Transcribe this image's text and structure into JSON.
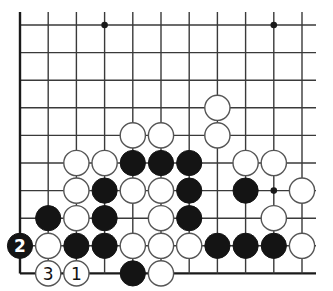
{
  "diagram": {
    "type": "go-board-fragment",
    "columns": 11,
    "rows": 10,
    "edges": {
      "left": true,
      "bottom": true,
      "top": false,
      "right": false
    },
    "origin_x": 20,
    "origin_y": 25,
    "spacing_x": 28.2,
    "spacing_y": 27.6,
    "colors": {
      "black": "#141414",
      "white": "#ffffff",
      "line": "#3a3a3a"
    },
    "star_points": [
      {
        "col": 3,
        "row": 0
      },
      {
        "col": 9,
        "row": 0
      },
      {
        "col": 9,
        "row": 6
      }
    ],
    "stones": [
      {
        "color": "white",
        "col": 7,
        "row": 3
      },
      {
        "color": "white",
        "col": 4,
        "row": 4
      },
      {
        "color": "white",
        "col": 5,
        "row": 4
      },
      {
        "color": "white",
        "col": 7,
        "row": 4
      },
      {
        "color": "white",
        "col": 2,
        "row": 5
      },
      {
        "color": "white",
        "col": 3,
        "row": 5
      },
      {
        "color": "black",
        "col": 4,
        "row": 5
      },
      {
        "color": "black",
        "col": 5,
        "row": 5
      },
      {
        "color": "black",
        "col": 6,
        "row": 5
      },
      {
        "color": "white",
        "col": 8,
        "row": 5
      },
      {
        "color": "white",
        "col": 9,
        "row": 5
      },
      {
        "color": "white",
        "col": 2,
        "row": 6
      },
      {
        "color": "black",
        "col": 3,
        "row": 6
      },
      {
        "color": "white",
        "col": 4,
        "row": 6
      },
      {
        "color": "white",
        "col": 5,
        "row": 6
      },
      {
        "color": "black",
        "col": 6,
        "row": 6
      },
      {
        "color": "black",
        "col": 8,
        "row": 6
      },
      {
        "color": "white",
        "col": 10,
        "row": 6
      },
      {
        "color": "black",
        "col": 1,
        "row": 7
      },
      {
        "color": "white",
        "col": 2,
        "row": 7
      },
      {
        "color": "black",
        "col": 3,
        "row": 7
      },
      {
        "color": "white",
        "col": 5,
        "row": 7
      },
      {
        "color": "black",
        "col": 6,
        "row": 7
      },
      {
        "color": "white",
        "col": 9,
        "row": 7
      },
      {
        "color": "black",
        "col": 0,
        "row": 8,
        "label": "2"
      },
      {
        "color": "white",
        "col": 1,
        "row": 8
      },
      {
        "color": "black",
        "col": 2,
        "row": 8
      },
      {
        "color": "black",
        "col": 3,
        "row": 8
      },
      {
        "color": "white",
        "col": 4,
        "row": 8
      },
      {
        "color": "white",
        "col": 5,
        "row": 8
      },
      {
        "color": "white",
        "col": 6,
        "row": 8
      },
      {
        "color": "black",
        "col": 7,
        "row": 8
      },
      {
        "color": "black",
        "col": 8,
        "row": 8
      },
      {
        "color": "black",
        "col": 9,
        "row": 8
      },
      {
        "color": "white",
        "col": 10,
        "row": 8
      },
      {
        "color": "white",
        "col": 1,
        "row": 9,
        "label": "3"
      },
      {
        "color": "white",
        "col": 2,
        "row": 9,
        "label": "1"
      },
      {
        "color": "black",
        "col": 4,
        "row": 9
      },
      {
        "color": "white",
        "col": 5,
        "row": 9
      }
    ],
    "move_labels": [
      "1",
      "2",
      "3"
    ]
  }
}
